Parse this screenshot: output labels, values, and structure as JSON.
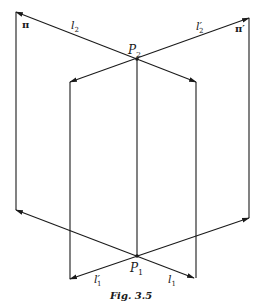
{
  "figure": {
    "caption": "Fig. 3.5",
    "planes": {
      "pi": "π",
      "pi_prime": "π′"
    },
    "points": {
      "P2": {
        "label": "P",
        "sub": "2",
        "x": 137,
        "y": 59
      },
      "P1": {
        "label": "P",
        "sub": "1",
        "x": 137,
        "y": 256
      }
    },
    "lines": {
      "l2": {
        "label": "l",
        "sub": "2"
      },
      "l2_prime": {
        "label": "l′",
        "sub": "2"
      },
      "l1": {
        "label": "l",
        "sub": "1"
      },
      "l1_prime": {
        "label": "l′",
        "sub": "1"
      }
    },
    "colors": {
      "stroke": "#1a1a1a",
      "background": "#ffffff"
    }
  }
}
